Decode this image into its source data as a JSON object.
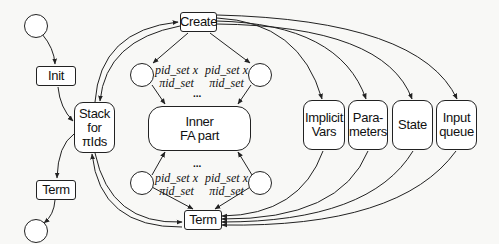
{
  "diagram": {
    "left": {
      "init_label": "Init",
      "stack_lines": [
        "Stack",
        "for",
        "πIds"
      ],
      "term_label": "Term"
    },
    "center": {
      "create_label": "Create",
      "term_label": "Term",
      "inner_lines": [
        "Inner",
        "FA part"
      ],
      "place_label_line1": "pid_set x",
      "place_label_line2": "πid_set",
      "ellipsis": "..."
    },
    "right": {
      "boxes": [
        {
          "line1": "Implicit",
          "line2": "Vars"
        },
        {
          "line1": "Para-",
          "line2": "meters"
        },
        {
          "line1": "State",
          "line2": ""
        },
        {
          "line1": "Input",
          "line2": "queue"
        }
      ]
    }
  }
}
